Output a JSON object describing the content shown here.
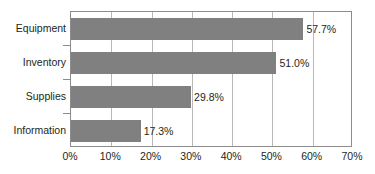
{
  "chart_data": {
    "type": "bar",
    "orientation": "horizontal",
    "title": "",
    "xlabel": "",
    "ylabel": "",
    "categories": [
      "Equipment",
      "Inventory",
      "Supplies",
      "Information"
    ],
    "values": [
      57.7,
      51.0,
      29.8,
      17.3
    ],
    "value_labels": [
      "57.7%",
      "51.0%",
      "29.8%",
      "17.3%"
    ],
    "xlim": [
      0,
      70
    ],
    "xticks": [
      0,
      10,
      20,
      30,
      40,
      50,
      60,
      70
    ],
    "xtick_labels": [
      "0%",
      "10%",
      "20%",
      "30%",
      "40%",
      "50%",
      "60%",
      "70%"
    ],
    "grid": true,
    "grid_axis": "x",
    "legend": false,
    "bar_color": "#808080",
    "text_color": "#231f20",
    "gridline_color": "#b8b8b8",
    "frame_color": "#8c8c8c",
    "background": "#ffffff"
  }
}
